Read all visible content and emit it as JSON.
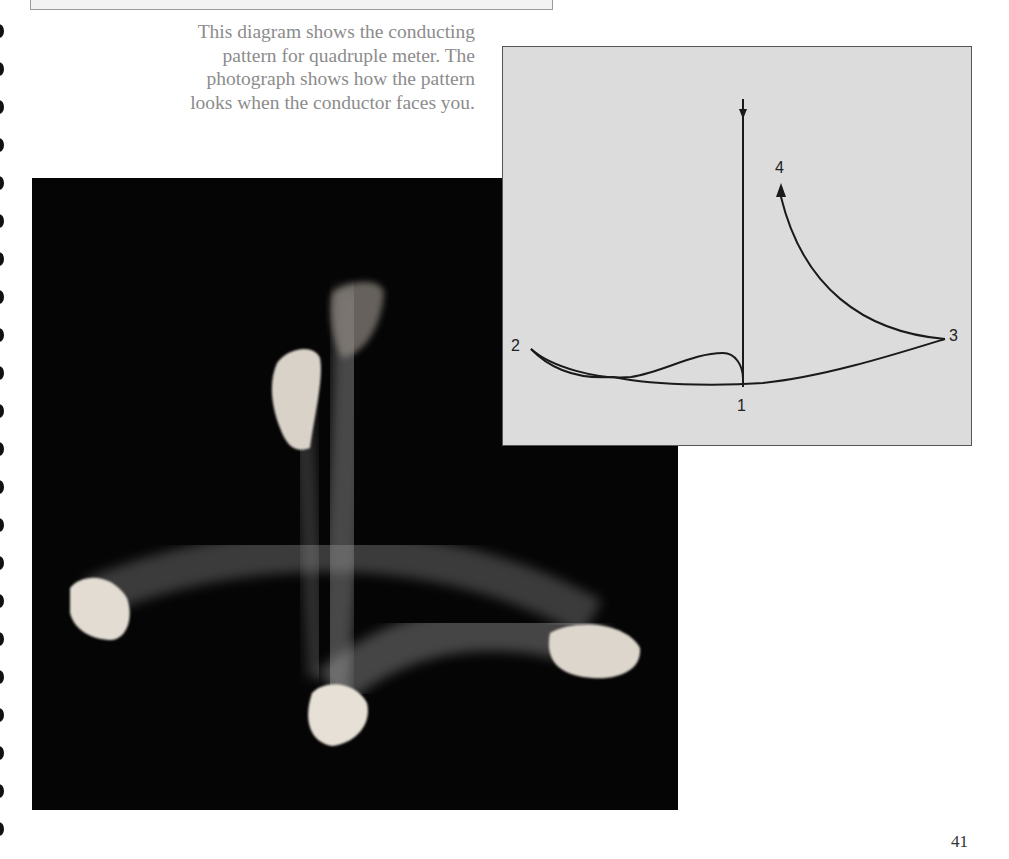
{
  "caption": {
    "lines": [
      "This diagram shows the conducting",
      "pattern for quadruple meter. The",
      "photograph shows how the pattern",
      "looks when the conductor faces you."
    ]
  },
  "diagram": {
    "beats": [
      {
        "label": "1"
      },
      {
        "label": "2"
      },
      {
        "label": "3"
      },
      {
        "label": "4"
      }
    ],
    "colors": {
      "background": "#dcdcdc",
      "stroke": "#1a1a1a"
    }
  },
  "photo": {
    "description": "Long-exposure photograph of a conductor's hand tracing the quadruple meter pattern"
  },
  "page": {
    "number": "41"
  }
}
